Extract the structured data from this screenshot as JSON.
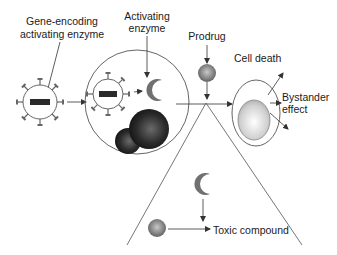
{
  "labels": {
    "gene_encoding_line1": "Gene-encoding",
    "gene_encoding_line2": "activating enzyme",
    "activating_line1": "Activating",
    "activating_line2": "enzyme",
    "prodrug": "Prodrug",
    "cell_death": "Cell death",
    "bystander_line1": "Bystander",
    "bystander_line2": "effect",
    "toxic_compound": "Toxic compound"
  },
  "colors": {
    "line": "#555555",
    "enzyme": "#6e6e6e",
    "gene_bar": "#2a2a2a",
    "nucleus_dark": "#1c1c1c",
    "prodrug": "#7a7a7a",
    "cell_nucleus": "#d9d9d9"
  }
}
